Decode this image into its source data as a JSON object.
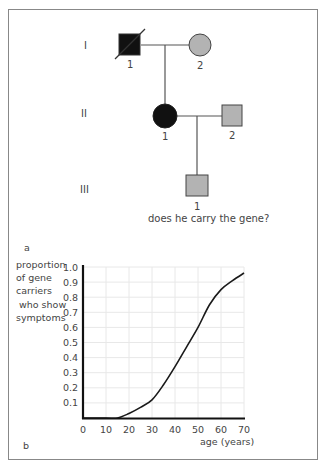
{
  "panel_a": {
    "label": "a",
    "generations": [
      "I",
      "II",
      "III"
    ],
    "individuals": [
      {
        "gen": "I",
        "num": "1",
        "sex": "male",
        "status": "affected-deceased"
      },
      {
        "gen": "I",
        "num": "2",
        "sex": "female",
        "status": "unaffected"
      },
      {
        "gen": "II",
        "num": "1",
        "sex": "female",
        "status": "affected"
      },
      {
        "gen": "II",
        "num": "2",
        "sex": "male",
        "status": "unaffected"
      },
      {
        "gen": "III",
        "num": "1",
        "sex": "male",
        "status": "unknown"
      }
    ],
    "question": "does he carry the gene?"
  },
  "panel_b": {
    "label": "b",
    "ylabel_lines": [
      "proportion",
      "of gene",
      "carriers",
      "who show",
      "symptoms"
    ],
    "xlabel": "age (years)"
  },
  "colors": {
    "affected": "#111111",
    "unaffected": "#b3b3b3",
    "line": "#555555",
    "grid": "#e8e8e8",
    "curve": "#1a1a1a"
  },
  "chart_data": {
    "type": "line",
    "title": "",
    "xlabel": "age (years)",
    "ylabel": "proportion of gene carriers who show symptoms",
    "x_ticks": [
      0,
      10,
      20,
      30,
      40,
      50,
      60,
      70
    ],
    "y_ticks": [
      0.1,
      0.2,
      0.3,
      0.4,
      0.5,
      0.6,
      0.7,
      0.8,
      0.9,
      1.0
    ],
    "xlim": [
      0,
      70
    ],
    "ylim": [
      0,
      1.0
    ],
    "grid": true,
    "series": [
      {
        "name": "penetrance",
        "x": [
          0,
          10,
          15,
          20,
          25,
          30,
          35,
          40,
          45,
          50,
          55,
          60,
          65,
          70
        ],
        "y": [
          0,
          0,
          0.0,
          0.03,
          0.07,
          0.12,
          0.22,
          0.34,
          0.47,
          0.6,
          0.75,
          0.85,
          0.91,
          0.96
        ]
      }
    ]
  }
}
